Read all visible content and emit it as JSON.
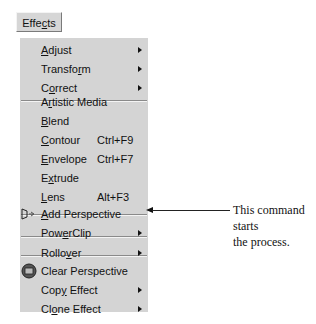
{
  "menubar": {
    "label": "Effects",
    "mnemonic_index": 4
  },
  "menu": {
    "items": [
      {
        "label": "Adjust",
        "u": 0,
        "submenu": true
      },
      {
        "label": "Transform",
        "u": 7,
        "submenu": true
      },
      {
        "label": "Correct",
        "u": 1,
        "submenu": true
      },
      {
        "label": "Artistic Media",
        "u": 1
      },
      {
        "label": "Blend",
        "u": 0
      },
      {
        "label": "Contour",
        "u": 0,
        "shortcut": "Ctrl+F9"
      },
      {
        "label": "Envelope",
        "u": 0,
        "shortcut": "Ctrl+F7"
      },
      {
        "label": "Extrude",
        "u": 1
      },
      {
        "label": "Lens",
        "u": 0,
        "shortcut": "Alt+F3"
      },
      {
        "label": "Add Perspective",
        "u": 0,
        "icon": "perspective-icon"
      },
      {
        "label": "PowerClip",
        "u": 3,
        "submenu": true
      },
      {
        "label": "Rollover",
        "u": 5,
        "submenu": true
      },
      {
        "label": "Clear Perspective",
        "icon": "clear-perspective-icon"
      },
      {
        "label": "Copy Effect",
        "u": 3,
        "submenu": true
      },
      {
        "label": "Clone Effect",
        "u": 2,
        "submenu": true
      }
    ]
  },
  "annotation": {
    "text_line1": "This command starts",
    "text_line2": "the process."
  },
  "colors": {
    "menu_bg": "#d4d4d4",
    "text": "#111111"
  }
}
